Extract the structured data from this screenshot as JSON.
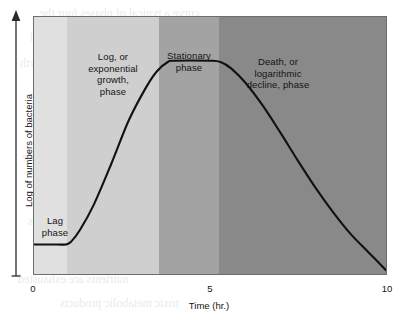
{
  "chart_data": {
    "type": "line",
    "title": "",
    "xlabel": "Time (hr.)",
    "ylabel": "Log of numbers of bacteria",
    "xlim": [
      0,
      10
    ],
    "ylim": [
      0,
      1
    ],
    "xticks": [
      {
        "value": 0,
        "label": "0"
      },
      {
        "value": 5,
        "label": "5"
      },
      {
        "value": 10,
        "label": "10"
      }
    ],
    "yticks": [],
    "grid": false,
    "legend": "none",
    "series": [
      {
        "name": "Bacterial growth curve",
        "color": "#111111",
        "points": [
          {
            "x": 0.0,
            "y": 0.115
          },
          {
            "x": 0.5,
            "y": 0.115
          },
          {
            "x": 0.9,
            "y": 0.115
          },
          {
            "x": 1.05,
            "y": 0.125
          },
          {
            "x": 1.3,
            "y": 0.17
          },
          {
            "x": 1.7,
            "y": 0.27
          },
          {
            "x": 2.2,
            "y": 0.43
          },
          {
            "x": 2.7,
            "y": 0.6
          },
          {
            "x": 3.2,
            "y": 0.73
          },
          {
            "x": 3.5,
            "y": 0.79
          },
          {
            "x": 3.8,
            "y": 0.825
          },
          {
            "x": 4.0,
            "y": 0.83
          },
          {
            "x": 5.0,
            "y": 0.83
          },
          {
            "x": 5.3,
            "y": 0.825
          },
          {
            "x": 5.6,
            "y": 0.8
          },
          {
            "x": 6.0,
            "y": 0.745
          },
          {
            "x": 6.5,
            "y": 0.655
          },
          {
            "x": 7.0,
            "y": 0.55
          },
          {
            "x": 7.5,
            "y": 0.44
          },
          {
            "x": 8.0,
            "y": 0.335
          },
          {
            "x": 8.5,
            "y": 0.24
          },
          {
            "x": 9.0,
            "y": 0.155
          },
          {
            "x": 9.5,
            "y": 0.085
          },
          {
            "x": 10.0,
            "y": 0.015
          }
        ]
      }
    ],
    "bands": [
      {
        "name": "lag",
        "label": "Lag\nphase",
        "x_start": 0.0,
        "x_end": 0.95,
        "color": "#e0e0e0"
      },
      {
        "name": "log",
        "label": "Log, or\nexponential\ngrowth,\nphase",
        "x_start": 0.95,
        "x_end": 3.55,
        "color": "#cfcfcf"
      },
      {
        "name": "stationary",
        "label": "Stationary\nphase",
        "x_start": 3.55,
        "x_end": 5.25,
        "color": "#a3a3a3"
      },
      {
        "name": "death",
        "label": "Death, or\nlogarithmic\ndecline, phase",
        "x_start": 5.25,
        "x_end": 10.0,
        "color": "#898989"
      }
    ]
  },
  "axes": {
    "x_title": "Time (hr.)",
    "y_title": "Log of numbers of bacteria",
    "x_tick_labels": [
      "0",
      "5",
      "10"
    ]
  },
  "bands": {
    "lag": {
      "label": "Lag\nphase"
    },
    "log": {
      "label": "Log, or\nexponential\ngrowth,\nphase"
    },
    "stationary": {
      "label": "Stationary\nphase"
    },
    "death": {
      "label": "Death, or\nlogarithmic\ndecline, phase"
    }
  },
  "colors": {
    "band_lag": "#e0e0e0",
    "band_log": "#cfcfcf",
    "band_stationary": "#a3a3a3",
    "band_death": "#898989",
    "curve": "#111111",
    "frame": "#6d6d6d",
    "text": "#141414",
    "background": "#ffffff"
  }
}
